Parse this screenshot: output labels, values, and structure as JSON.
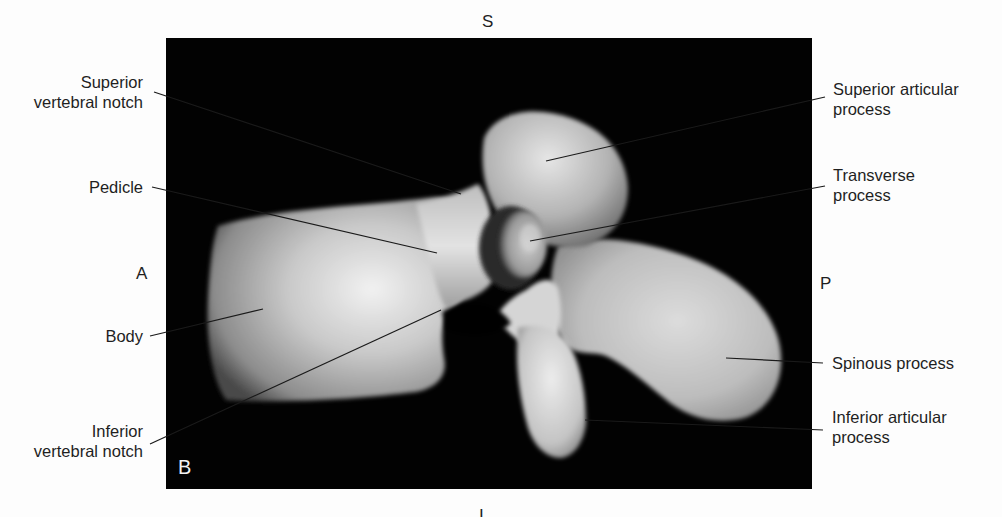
{
  "figure": {
    "panel_letter": "B",
    "colors": {
      "background": "#fdfdfd",
      "panel": "#020202",
      "bone_light": "#e8e8e8",
      "bone_mid": "#a9a9a9",
      "bone_dark": "#5a5a5a",
      "text": "#1f1f1f",
      "leader": "#1a1a1a"
    }
  },
  "orientation": {
    "superior": "S",
    "inferior": "I",
    "anterior": "A",
    "posterior": "P"
  },
  "labels_left": [
    {
      "id": "superior-vertebral-notch",
      "lines": [
        "Superior",
        "vertebral notch"
      ]
    },
    {
      "id": "pedicle",
      "lines": [
        "Pedicle"
      ]
    },
    {
      "id": "body",
      "lines": [
        "Body"
      ]
    },
    {
      "id": "inferior-vertebral-notch",
      "lines": [
        "Inferior",
        "vertebral notch"
      ]
    }
  ],
  "labels_right": [
    {
      "id": "superior-articular-process",
      "lines": [
        "Superior articular",
        "process"
      ]
    },
    {
      "id": "transverse-process",
      "lines": [
        "Transverse",
        "process"
      ]
    },
    {
      "id": "spinous-process",
      "lines": [
        "Spinous process"
      ]
    },
    {
      "id": "inferior-articular-process",
      "lines": [
        "Inferior articular",
        "process"
      ]
    }
  ],
  "leader_lines": [
    {
      "for": "superior-vertebral-notch",
      "x1": 154,
      "y1": 92,
      "x2": 461,
      "y2": 194
    },
    {
      "for": "pedicle",
      "x1": 152,
      "y1": 187,
      "x2": 437,
      "y2": 253
    },
    {
      "for": "body",
      "x1": 150,
      "y1": 336,
      "x2": 263,
      "y2": 309
    },
    {
      "for": "inferior-vertebral-notch",
      "x1": 150,
      "y1": 444,
      "x2": 441,
      "y2": 310
    },
    {
      "for": "superior-articular-process",
      "x1": 825,
      "y1": 97,
      "x2": 546,
      "y2": 161
    },
    {
      "for": "transverse-process",
      "x1": 825,
      "y1": 186,
      "x2": 530,
      "y2": 241
    },
    {
      "for": "spinous-process",
      "x1": 823,
      "y1": 363,
      "x2": 726,
      "y2": 358
    },
    {
      "for": "inferior-articular-process",
      "x1": 823,
      "y1": 430,
      "x2": 585,
      "y2": 420
    }
  ]
}
